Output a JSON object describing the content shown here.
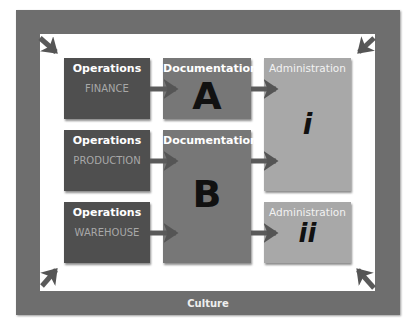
{
  "frame": {
    "label": "Culture",
    "color": "#6e6e6e"
  },
  "operations": [
    {
      "title": "Operations",
      "subtitle": "FINANCE"
    },
    {
      "title": "Operations",
      "subtitle": "PRODUCTION"
    },
    {
      "title": "Operations",
      "subtitle": "WAREHOUSE"
    }
  ],
  "documentation": [
    {
      "title": "Documentation",
      "letter": "A"
    },
    {
      "title": "Documentation",
      "letter": "B"
    }
  ],
  "administration": [
    {
      "title": "Administration",
      "numeral": "i"
    },
    {
      "title": "Administration",
      "numeral": "ii"
    }
  ],
  "colors": {
    "operations": "#4f4f4f",
    "documentation": "#777777",
    "administration": "#a8a8a8",
    "arrow": "#5a5a5a"
  }
}
